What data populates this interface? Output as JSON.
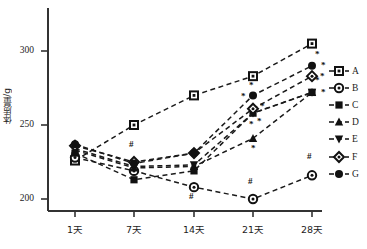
{
  "chart_data": {
    "type": "line",
    "title": "",
    "xlabel": "",
    "ylabel": "体质量/g",
    "categories": [
      "1天",
      "7天",
      "14天",
      "21天",
      "28天"
    ],
    "x_tick_labels": [
      "1天",
      "7天",
      "14天",
      "21天",
      "28天"
    ],
    "y_tick_labels": [
      "200",
      "250",
      "300"
    ],
    "y_ticks": [
      200,
      250,
      300
    ],
    "ylim": [
      185,
      315
    ],
    "grid": false,
    "legend_position": "right",
    "line_style": "dashed",
    "series": [
      {
        "name": "A",
        "marker": "open-square",
        "values": [
          226,
          250,
          270,
          283,
          305
        ],
        "annotations": [
          "",
          "",
          "",
          "",
          ""
        ]
      },
      {
        "name": "B",
        "marker": "open-circle",
        "values": [
          228,
          219,
          208,
          200,
          216
        ],
        "annotations": [
          "",
          "",
          "#",
          "#",
          "#"
        ]
      },
      {
        "name": "C",
        "marker": "filled-square",
        "values": [
          231,
          213,
          219,
          258,
          272
        ],
        "annotations": [
          "",
          "",
          "",
          "*",
          "*"
        ]
      },
      {
        "name": "D",
        "marker": "filled-triangle",
        "values": [
          233,
          221,
          222,
          241,
          272
        ],
        "annotations": [
          "",
          "",
          "",
          "*",
          "*"
        ]
      },
      {
        "name": "E",
        "marker": "filled-inv-triangle",
        "values": [
          234,
          222,
          223,
          258,
          272
        ],
        "annotations": [
          "",
          "",
          "",
          "*",
          "*"
        ]
      },
      {
        "name": "F",
        "marker": "open-diamond",
        "values": [
          236,
          225,
          231,
          261,
          283
        ],
        "annotations": [
          "",
          "#",
          "",
          "*",
          "*"
        ]
      },
      {
        "name": "G",
        "marker": "filled-circle",
        "values": [
          237,
          224,
          231,
          270,
          290
        ],
        "annotations": [
          "",
          "",
          "",
          "*",
          "*"
        ]
      }
    ],
    "annotation_symbols": {
      "significance": "*",
      "comparison": "#"
    }
  },
  "legend": {
    "items": [
      {
        "label": "A"
      },
      {
        "label": "B"
      },
      {
        "label": "C"
      },
      {
        "label": "D"
      },
      {
        "label": "E"
      },
      {
        "label": "F"
      },
      {
        "label": "G"
      }
    ]
  },
  "axes": {
    "y_label": "体质量/g",
    "y_tick_0": "200",
    "y_tick_1": "250",
    "y_tick_2": "300",
    "x_tick_0": "1天",
    "x_tick_1": "7天",
    "x_tick_2": "14天",
    "x_tick_3": "21天",
    "x_tick_4": "28天"
  },
  "annotations": {
    "b_day14": "#",
    "b_day21": "#",
    "b_day28": "#",
    "f_day7": "#",
    "g_day21": "*",
    "c_day21": "*",
    "f_day21": "*",
    "e_day21": "*",
    "d_day21_top": "*",
    "d_day21_bot": "*",
    "g_day28": "*",
    "c_day28": "*",
    "f_day28": "*",
    "d_day28": "*"
  },
  "colors": {
    "line": "#1a1a1a",
    "axis": "#333333",
    "text": "#1c1c1c",
    "background": "#ffffff"
  }
}
